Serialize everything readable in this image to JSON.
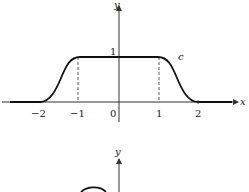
{
  "figure_top": {
    "x_axis_label": "x",
    "y_axis_label": "y",
    "curve_label": "c",
    "y_tick_label": "1",
    "x_tick_labels": [
      "−2",
      "−1",
      "0",
      "1",
      "2"
    ]
  },
  "figure_bottom": {
    "y_axis_label": "y"
  },
  "colors": {
    "curve": "#111111",
    "axis": "#333333",
    "background": "#ffffff"
  }
}
